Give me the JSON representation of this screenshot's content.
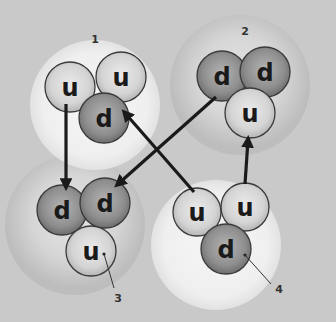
{
  "diagram": {
    "type": "quark-composition",
    "background_color": "#c9c9c9",
    "groups": [
      {
        "id": "1",
        "label": "1",
        "halo": "light",
        "cx": 95,
        "cy": 105,
        "r": 65,
        "label_x": 95,
        "label_y": 39,
        "quarks": [
          {
            "flavor": "u",
            "cx": 70,
            "cy": 87,
            "r": 25
          },
          {
            "flavor": "u",
            "cx": 121,
            "cy": 77,
            "r": 25
          },
          {
            "flavor": "d",
            "cx": 104,
            "cy": 118,
            "r": 25
          }
        ]
      },
      {
        "id": "2",
        "label": "2",
        "halo": "dark",
        "cx": 240,
        "cy": 85,
        "r": 70,
        "label_x": 245,
        "label_y": 31,
        "quarks": [
          {
            "flavor": "d",
            "cx": 222,
            "cy": 76,
            "r": 25
          },
          {
            "flavor": "d",
            "cx": 265,
            "cy": 72,
            "r": 25
          },
          {
            "flavor": "u",
            "cx": 250,
            "cy": 113,
            "r": 25
          }
        ]
      },
      {
        "id": "3",
        "label": "3",
        "halo": "dark",
        "cx": 75,
        "cy": 225,
        "r": 70,
        "label_x": 118,
        "label_y": 298,
        "pointer": {
          "x1": 104,
          "y1": 254,
          "x2": 114,
          "y2": 288
        },
        "quarks": [
          {
            "flavor": "d",
            "cx": 62,
            "cy": 210,
            "r": 25
          },
          {
            "flavor": "d",
            "cx": 105,
            "cy": 203,
            "r": 25
          },
          {
            "flavor": "u",
            "cx": 91,
            "cy": 251,
            "r": 25
          }
        ]
      },
      {
        "id": "4",
        "label": "4",
        "halo": "light",
        "cx": 216,
        "cy": 245,
        "r": 65,
        "label_x": 279,
        "label_y": 289,
        "pointer": {
          "x1": 245,
          "y1": 255,
          "x2": 271,
          "y2": 284
        },
        "quarks": [
          {
            "flavor": "u",
            "cx": 197,
            "cy": 212,
            "r": 24
          },
          {
            "flavor": "u",
            "cx": 245,
            "cy": 207,
            "r": 24
          },
          {
            "flavor": "d",
            "cx": 226,
            "cy": 249,
            "r": 25
          }
        ]
      }
    ],
    "arrows": [
      {
        "from": "group-1 u",
        "to": "group-3 d",
        "x1": 66,
        "y1": 104,
        "x2": 66,
        "y2": 186
      },
      {
        "from": "group-2 d",
        "to": "group-3 d",
        "x1": 216,
        "y1": 97,
        "x2": 118,
        "y2": 184
      },
      {
        "from": "group-4 u",
        "to": "group-1 d",
        "x1": 194,
        "y1": 192,
        "x2": 125,
        "y2": 113
      },
      {
        "from": "group-4 u",
        "to": "group-2 u",
        "x1": 245,
        "y1": 184,
        "x2": 248,
        "y2": 140
      }
    ]
  }
}
